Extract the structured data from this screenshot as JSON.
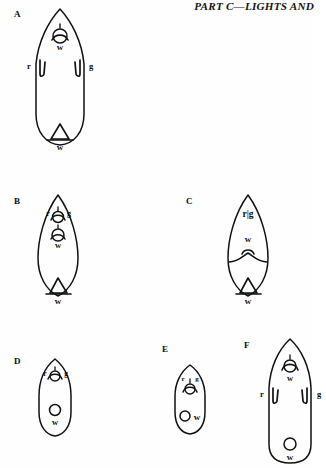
{
  "page": {
    "running_header": "PART C—LIGHTS AND",
    "background_color": "#fefefe",
    "ink_color": "#111111"
  },
  "figures": [
    {
      "id": "A",
      "label": "A",
      "hull_style": "pointed-bow-rounded-stern",
      "lights": [
        {
          "name": "masthead-light",
          "label": "w",
          "color": "white",
          "symbol": "lantern",
          "label_position": "below"
        },
        {
          "name": "port-sidelight",
          "label": "r",
          "color": "red",
          "symbol": "screen-bracket",
          "label_position": "left"
        },
        {
          "name": "starboard-sidelight",
          "label": "g",
          "color": "green",
          "symbol": "screen-bracket",
          "label_position": "right"
        },
        {
          "name": "sternlight",
          "label": "w",
          "color": "white",
          "symbol": "triangle-screen",
          "label_position": "below"
        }
      ]
    },
    {
      "id": "B",
      "label": "B",
      "hull_style": "double-ended",
      "lights": [
        {
          "name": "bicolor-sidelight",
          "label": "r",
          "label2": "g",
          "color": "red-green",
          "symbol": "lantern",
          "label_position": "flanking"
        },
        {
          "name": "masthead-light",
          "label": "w",
          "color": "white",
          "symbol": "lantern",
          "label_position": "below"
        },
        {
          "name": "sternlight",
          "label": "w",
          "color": "white",
          "symbol": "triangle-screen",
          "label_position": "below"
        }
      ]
    },
    {
      "id": "C",
      "label": "C",
      "hull_style": "double-ended",
      "lights": [
        {
          "name": "bicolor-sidelight",
          "label": "r|g",
          "color": "red-green",
          "symbol": "divided-bar",
          "label_position": "inline"
        },
        {
          "name": "masthead-light",
          "label": "w",
          "color": "white",
          "symbol": "lantern",
          "label_position": "above"
        },
        {
          "name": "sternlight",
          "label": "w",
          "color": "white",
          "symbol": "triangle-screen",
          "label_position": "below"
        }
      ]
    },
    {
      "id": "D",
      "label": "D",
      "hull_style": "small-pointed-bow",
      "lights": [
        {
          "name": "bicolor-sidelight",
          "label": "r",
          "label2": "g",
          "color": "red-green",
          "symbol": "lantern",
          "label_position": "flanking"
        },
        {
          "name": "all-round-light",
          "label": "w",
          "color": "white",
          "symbol": "circle",
          "label_position": "below"
        }
      ]
    },
    {
      "id": "E",
      "label": "E",
      "hull_style": "small-rounded",
      "lights": [
        {
          "name": "bicolor-sidelight",
          "label": "r",
          "label2": "g",
          "color": "red-green",
          "symbol": "lantern",
          "label_position": "above"
        },
        {
          "name": "all-round-light",
          "label": "w",
          "color": "white",
          "symbol": "circle",
          "label_position": "right"
        }
      ]
    },
    {
      "id": "F",
      "label": "F",
      "hull_style": "pointed-bow-transom-stern",
      "lights": [
        {
          "name": "masthead-light",
          "label": "w",
          "color": "white",
          "symbol": "lantern",
          "label_position": "below"
        },
        {
          "name": "port-sidelight",
          "label": "r",
          "color": "red",
          "symbol": "screen-bracket",
          "label_position": "left"
        },
        {
          "name": "starboard-sidelight",
          "label": "g",
          "color": "green",
          "symbol": "screen-bracket",
          "label_position": "right"
        },
        {
          "name": "sternlight",
          "label": "w",
          "color": "white",
          "symbol": "circle",
          "label_position": "below"
        }
      ]
    }
  ]
}
